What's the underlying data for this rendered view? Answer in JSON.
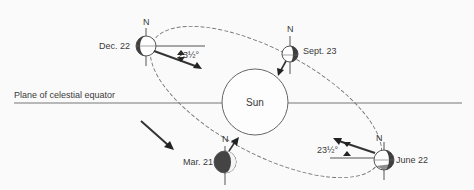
{
  "diagram": {
    "equator_label": "Plane of celestial equator",
    "sun_label": "Sun",
    "tilt_label": "23½°",
    "positions": [
      {
        "id": "dec22",
        "date": "Dec. 22",
        "north": "N"
      },
      {
        "id": "sept23",
        "date": "Sept. 23",
        "north": "N"
      },
      {
        "id": "mar21",
        "date": "Mar. 21",
        "north": "N"
      },
      {
        "id": "june22",
        "date": "June 22",
        "north": "N"
      }
    ],
    "colors": {
      "line": "#555555",
      "shade": "#4a4a4a",
      "background": "#fafafa"
    }
  }
}
